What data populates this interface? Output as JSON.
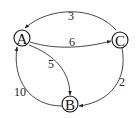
{
  "diagram": {
    "type": "directed-weighted-graph",
    "nodes": [
      {
        "id": "A",
        "label": "A"
      },
      {
        "id": "B",
        "label": "B"
      },
      {
        "id": "C",
        "label": "C"
      }
    ],
    "edges": [
      {
        "from": "C",
        "to": "A",
        "weight": "3"
      },
      {
        "from": "A",
        "to": "C",
        "weight": "6"
      },
      {
        "from": "A",
        "to": "B",
        "weight": "5"
      },
      {
        "from": "B",
        "to": "A",
        "weight": "10"
      },
      {
        "from": "C",
        "to": "B",
        "weight": "2"
      }
    ],
    "colors": {
      "stroke": "#333333",
      "background": "#ffffff"
    }
  }
}
